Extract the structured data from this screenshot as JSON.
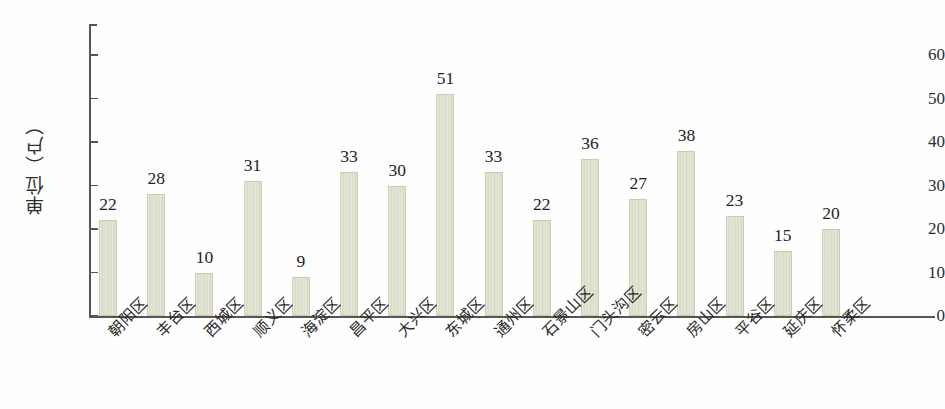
{
  "chart_data": {
    "type": "bar",
    "title": "",
    "subtitle": "",
    "xlabel": "",
    "ylabel": "单位（户）",
    "ylim": [
      0,
      60
    ],
    "yticks": [
      0,
      10,
      20,
      30,
      40,
      50,
      60
    ],
    "ytick_labels": [
      "0",
      "10",
      "20",
      "30",
      "40",
      "50",
      "60"
    ],
    "grid": false,
    "legend": null,
    "bar_color": "#d9dcc6",
    "bar_edge_color": "#c8cdb4",
    "axis_color": "#555555",
    "show_value_labels": true,
    "categories": [
      "朝阳区",
      "丰台区",
      "西城区",
      "顺义区",
      "海淀区",
      "昌平区",
      "大兴区",
      "东城区",
      "通州区",
      "石景山区",
      "门头沟区",
      "密云区",
      "房山区",
      "平谷区",
      "延庆区",
      "怀柔区"
    ],
    "values": [
      22,
      28,
      10,
      31,
      9,
      33,
      30,
      51,
      33,
      22,
      36,
      27,
      38,
      23,
      15,
      20
    ],
    "value_labels": [
      "22",
      "28",
      "10",
      "31",
      "9",
      "33",
      "30",
      "51",
      "33",
      "22",
      "36",
      "27",
      "38",
      "23",
      "15",
      "20"
    ]
  }
}
